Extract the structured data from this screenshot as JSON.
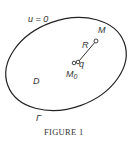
{
  "figure": {
    "caption": "Figure 1",
    "caption_display": "FIGURE 1",
    "labels": {
      "boundary_condition": "u = 0",
      "domain": "D",
      "boundary": "Γ",
      "point_m": "M",
      "point_m0": "M",
      "m0_subscript": "0",
      "distance": "R",
      "point_q": "q"
    }
  }
}
